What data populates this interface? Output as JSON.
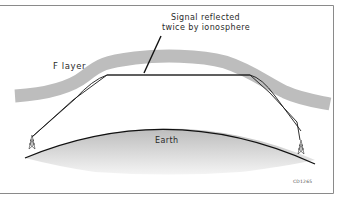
{
  "diagram": {
    "callout": {
      "line1": "Signal reflected",
      "line2": "twice by ionosphere"
    },
    "layer_label": "F layer",
    "earth_label": "Earth",
    "figure_code": "CD1265",
    "colors": {
      "ionosphere": "#bdbdbd",
      "earth_top": "#c4c4c4",
      "earth_bottom": "#f2f2f2",
      "signal_line": "#1a1a1a",
      "frame": "#8a8a8a"
    },
    "elements": {
      "transmitter_tower": "tower-icon",
      "receiver_tower": "tower-icon"
    }
  }
}
